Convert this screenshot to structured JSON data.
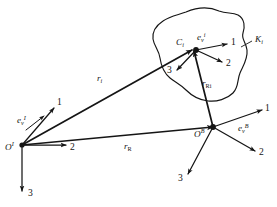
{
  "figure": {
    "type": "vector-diagram",
    "background_color": "#ffffff",
    "line_color": "#151515",
    "width": 277,
    "height": 207
  },
  "labels": {
    "origin_inertial": {
      "base": "O",
      "sup": "I"
    },
    "origin_body": {
      "base": "O",
      "sup": "B"
    },
    "point_ci": {
      "base": "C",
      "sub": "i"
    },
    "body_ki": {
      "base": "K",
      "sub": "i"
    },
    "basis_inertial": {
      "base": "e",
      "sub": "v",
      "sup": "I"
    },
    "basis_body": {
      "base": "e",
      "sub": "v",
      "sup": "B"
    },
    "basis_ci": {
      "base": "e",
      "sub": "v",
      "sup": "i"
    },
    "vec_ri": {
      "base": "r",
      "sub": "i"
    },
    "vec_rR": {
      "base": "r",
      "sub": "R"
    },
    "vec_rRi": {
      "base": "r",
      "sub": "Ri"
    },
    "axis_1": "1",
    "axis_2": "2",
    "axis_3": "3"
  },
  "frames": [
    {
      "name": "inertial-frame",
      "origin_label": "O",
      "origin_sup": "I",
      "axes": [
        "1",
        "2",
        "3"
      ]
    },
    {
      "name": "body-frame",
      "origin_label": "O",
      "origin_sup": "B",
      "axes": [
        "1",
        "2",
        "3"
      ]
    },
    {
      "name": "element-frame",
      "origin_label": "C",
      "origin_sub": "i",
      "axes": [
        "1",
        "2",
        "3"
      ]
    }
  ],
  "vectors": [
    {
      "name": "r_i",
      "from": "O^I",
      "to": "C_i",
      "label": "r",
      "sub": "i"
    },
    {
      "name": "r_R",
      "from": "O^I",
      "to": "O^B",
      "label": "r",
      "sub": "R"
    },
    {
      "name": "r_Ri",
      "from": "O^B",
      "to": "C_i",
      "label": "r",
      "sub": "Ri"
    }
  ]
}
